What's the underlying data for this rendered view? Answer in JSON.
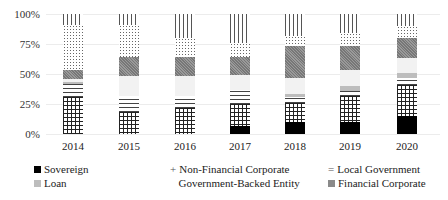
{
  "chart_data": {
    "type": "bar",
    "stacked": true,
    "percent": true,
    "title": "",
    "xlabel": "",
    "ylabel": "",
    "ylim": [
      0,
      100
    ],
    "yticks": [
      "0%",
      "25%",
      "50%",
      "75%",
      "100%"
    ],
    "grid": true,
    "legend_position": "bottom",
    "categories": [
      "2014",
      "2015",
      "2016",
      "2017",
      "2018",
      "2019",
      "2020"
    ],
    "series": [
      {
        "name": "Sovereign",
        "pattern": "solid-black",
        "values": [
          0,
          0,
          0,
          7,
          10,
          10,
          15
        ]
      },
      {
        "name": "Non-Financial Corporate",
        "pattern": "grid",
        "values": [
          31,
          18,
          22,
          18,
          16,
          22,
          26
        ]
      },
      {
        "name": "Local Government",
        "pattern": "horizontal-lines",
        "values": [
          11,
          14,
          10,
          12,
          5,
          4,
          6
        ]
      },
      {
        "name": "Loan",
        "pattern": "light-grey",
        "values": [
          1,
          0,
          0,
          0,
          2,
          4,
          4
        ]
      },
      {
        "name": "Government-Backed Entity",
        "pattern": "very-light",
        "values": [
          3,
          16,
          16,
          12,
          14,
          13,
          12
        ]
      },
      {
        "name": "Financial Corporate",
        "pattern": "dark-grey-checker",
        "values": [
          7,
          16,
          16,
          15,
          26,
          20,
          17
        ]
      },
      {
        "name": "",
        "pattern": "dots",
        "values": [
          38,
          27,
          16,
          12,
          9,
          11,
          10
        ]
      },
      {
        "name": "",
        "pattern": "vertical-lines",
        "values": [
          9,
          9,
          20,
          24,
          18,
          16,
          10
        ]
      }
    ]
  },
  "legend": [
    {
      "label": "Sovereign",
      "marker": "■",
      "row": 0,
      "col": 0
    },
    {
      "label": "Non-Financial Corporate",
      "marker": "+",
      "row": 0,
      "col": 1
    },
    {
      "label": "Local Government",
      "marker": "=",
      "row": 0,
      "col": 2
    },
    {
      "label": "Loan",
      "marker": "■",
      "row": 1,
      "col": 0
    },
    {
      "label": "Government-Backed Entity",
      "marker": "",
      "row": 1,
      "col": 1
    },
    {
      "label": "Financial Corporate",
      "marker": "■",
      "row": 1,
      "col": 2
    }
  ],
  "colors": {
    "sovereign": "#000000",
    "loan": "#bdbdbd",
    "gov_backed": "#f2f2f2",
    "financial_corp": "#8a8a8a",
    "gridline": "#ececec"
  }
}
